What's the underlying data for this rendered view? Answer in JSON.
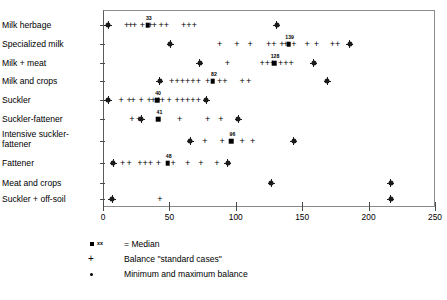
{
  "chart_data": {
    "type": "scatter",
    "title": "",
    "xlabel": "",
    "ylabel": "",
    "xlim": [
      0,
      250
    ],
    "xticks": [
      0,
      50,
      100,
      150,
      200,
      250
    ],
    "grid": false,
    "legend_position": "below-axis",
    "categories": [
      "Milk herbage",
      "Specialized milk",
      "Milk + meat",
      "Milk and crops",
      "Suckler",
      "Suckler-fattener",
      "Intensive suckler-\nfattener",
      "Fattener",
      "Meat and crops",
      "Suckler + off-soil"
    ],
    "series": [
      {
        "name": "Median",
        "symbol": "filled-square",
        "values": [
          33,
          139,
          128,
          82,
          40,
          41,
          96,
          48,
          null,
          null
        ],
        "labels": [
          "33",
          "139",
          "128",
          "82",
          "40",
          "41",
          "96",
          "48",
          "",
          ""
        ]
      },
      {
        "name": "Minimum and maximum balance",
        "symbol": "dot-cross",
        "points": [
          [
            3,
            130
          ],
          [
            50,
            185
          ],
          [
            72,
            158
          ],
          [
            42,
            168
          ],
          [
            3,
            77
          ],
          [
            28,
            101
          ],
          [
            65,
            143
          ],
          [
            7,
            93
          ],
          [
            126,
            216
          ],
          [
            6,
            216
          ]
        ]
      },
      {
        "name": "Balance \"standard cases\"",
        "symbol": "plus",
        "points_by_row": [
          [
            17,
            20,
            23,
            29,
            35,
            38,
            43,
            47,
            60,
            64,
            68
          ],
          [
            87,
            100,
            110,
            124,
            128,
            134,
            137,
            143,
            153,
            160,
            172,
            176
          ],
          [
            93,
            119,
            123,
            127,
            133,
            137,
            141
          ],
          [
            51,
            55,
            59,
            63,
            67,
            71,
            78,
            87,
            91,
            104,
            109
          ],
          [
            13,
            19,
            22,
            28,
            34,
            37,
            41,
            44,
            49,
            55,
            59,
            63,
            67,
            71
          ],
          [
            21,
            26,
            57,
            78,
            88
          ],
          [
            76,
            89,
            104,
            112
          ],
          [
            14,
            19,
            27,
            31,
            35,
            41,
            52,
            63,
            73,
            85
          ],
          [],
          [
            42
          ]
        ]
      }
    ]
  },
  "legend": {
    "items": [
      {
        "symbol": "median-square",
        "annot": "xx",
        "label": "= Median"
      },
      {
        "symbol": "plus",
        "annot": "",
        "label": "Balance \"standard cases\""
      },
      {
        "symbol": "dot",
        "annot": "",
        "label": "Minimum and maximum balance"
      }
    ]
  },
  "caption": {
    "text": ""
  }
}
